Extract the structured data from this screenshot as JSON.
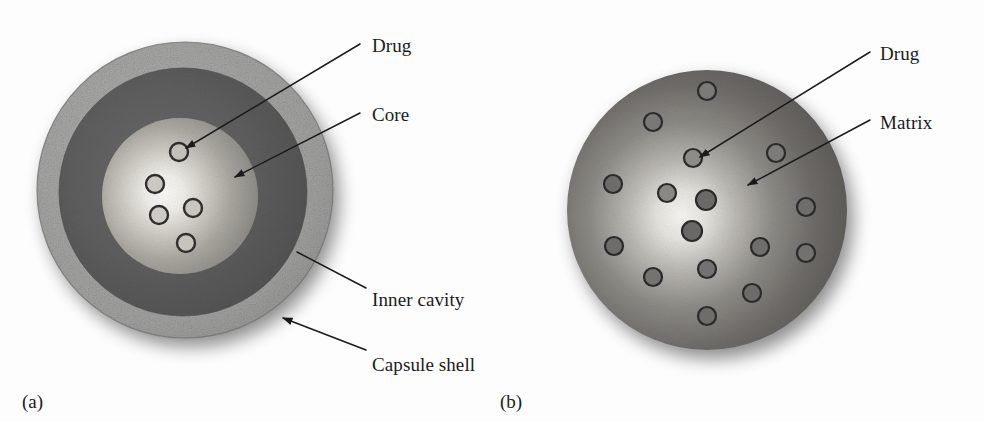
{
  "figure": {
    "background_color": "#fdfdfd",
    "width": 984,
    "height": 422,
    "ink_color": "#1b1b1b"
  },
  "panels": [
    {
      "id": "a",
      "panel_label": "(a)",
      "panel_label_x": 22,
      "panel_label_y": 392,
      "system_type": "reservoir",
      "center_x": 185,
      "center_y": 190,
      "outer_radius": 148,
      "layers": [
        {
          "name": "capsule-shell",
          "radius": 148,
          "color": "#9b9b9b",
          "texture": "speckled"
        },
        {
          "name": "inner-cavity",
          "radius": 124,
          "color": "#5a5a5a",
          "texture": "smooth"
        },
        {
          "name": "core",
          "radius": 78,
          "color": "#8d8d8d",
          "highlight_color": "#f2f0ec",
          "texture": "radial-gradient"
        }
      ],
      "drug_particles": [
        {
          "cx": 179,
          "cy": 152,
          "r": 9
        },
        {
          "cx": 155,
          "cy": 184,
          "r": 9
        },
        {
          "cx": 193,
          "cy": 208,
          "r": 9
        },
        {
          "cx": 159,
          "cy": 215,
          "r": 9
        },
        {
          "cx": 186,
          "cy": 243,
          "r": 9
        }
      ],
      "particle_outline_color": "#2e2e2e",
      "particle_fill_color": "#b8b5ae",
      "callouts": [
        {
          "label": "Drug",
          "text_x": 372,
          "text_y": 36,
          "line_x1": 360,
          "line_y1": 44,
          "line_x2": 186,
          "line_y2": 148,
          "arrowhead": true
        },
        {
          "label": "Core",
          "text_x": 372,
          "text_y": 105,
          "line_x1": 360,
          "line_y1": 113,
          "line_x2": 235,
          "line_y2": 177,
          "arrowhead": true
        },
        {
          "label": "Inner cavity",
          "text_x": 372,
          "text_y": 290,
          "line_x1": 366,
          "line_y1": 288,
          "line_x2": 297,
          "line_y2": 252,
          "arrowhead": false
        },
        {
          "label": "Capsule shell",
          "text_x": 372,
          "text_y": 355,
          "line_x1": 366,
          "line_y1": 350,
          "line_x2": 283,
          "line_y2": 318,
          "arrowhead": true
        }
      ]
    },
    {
      "id": "b",
      "panel_label": "(b)",
      "panel_label_x": 500,
      "panel_label_y": 392,
      "system_type": "matrix",
      "center_x": 707,
      "center_y": 210,
      "outer_radius": 140,
      "layers": [
        {
          "name": "matrix",
          "radius": 140,
          "color": "#6e6e6e",
          "highlight_color": "#f4f2ee",
          "texture": "radial-gradient"
        }
      ],
      "drug_particles": [
        {
          "cx": 707,
          "cy": 91,
          "r": 9
        },
        {
          "cx": 653,
          "cy": 122,
          "r": 9
        },
        {
          "cx": 693,
          "cy": 158,
          "r": 9
        },
        {
          "cx": 776,
          "cy": 153,
          "r": 9
        },
        {
          "cx": 613,
          "cy": 184,
          "r": 9
        },
        {
          "cx": 667,
          "cy": 193,
          "r": 9
        },
        {
          "cx": 706,
          "cy": 200,
          "r": 10
        },
        {
          "cx": 806,
          "cy": 207,
          "r": 9
        },
        {
          "cx": 692,
          "cy": 231,
          "r": 10
        },
        {
          "cx": 614,
          "cy": 246,
          "r": 9
        },
        {
          "cx": 760,
          "cy": 247,
          "r": 9
        },
        {
          "cx": 806,
          "cy": 253,
          "r": 9
        },
        {
          "cx": 707,
          "cy": 269,
          "r": 9
        },
        {
          "cx": 653,
          "cy": 277,
          "r": 9
        },
        {
          "cx": 752,
          "cy": 293,
          "r": 9
        },
        {
          "cx": 707,
          "cy": 316,
          "r": 9
        }
      ],
      "particle_outline_color": "#2a2a2a",
      "particle_fill_color": "#6a6a6a",
      "callouts": [
        {
          "label": "Drug",
          "text_x": 880,
          "text_y": 44,
          "line_x1": 870,
          "line_y1": 52,
          "line_x2": 700,
          "line_y2": 157,
          "arrowhead": true
        },
        {
          "label": "Matrix",
          "text_x": 880,
          "text_y": 113,
          "line_x1": 870,
          "line_y1": 120,
          "line_x2": 748,
          "line_y2": 185,
          "arrowhead": true
        }
      ]
    }
  ]
}
